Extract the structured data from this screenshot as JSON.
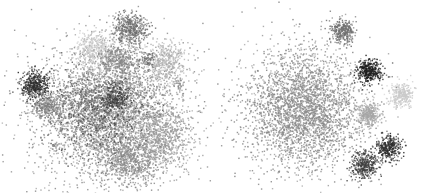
{
  "figure": {
    "width": 429,
    "height": 193,
    "background": "#ffffff"
  },
  "chart_data": [
    {
      "type": "scatter",
      "title": "",
      "xlabel": "",
      "ylabel": "",
      "axes_visible": false,
      "grid": false,
      "legend": null,
      "panel": {
        "x": 0,
        "width": 215
      },
      "description": "t-SNE style embedding with a large overlapping central mass and several satellite clusters, grayscale",
      "clusters": [
        {
          "cx": 105,
          "cy": 112,
          "sx": 38,
          "sy": 36,
          "n": 2600,
          "color": "#8c8c8c"
        },
        {
          "cx": 95,
          "cy": 100,
          "sx": 22,
          "sy": 18,
          "n": 700,
          "color": "#7a7a7a"
        },
        {
          "cx": 130,
          "cy": 120,
          "sx": 30,
          "sy": 24,
          "n": 900,
          "color": "#959595"
        },
        {
          "cx": 115,
          "cy": 97,
          "sx": 7,
          "sy": 7,
          "n": 220,
          "color": "#3a3a3a"
        },
        {
          "cx": 100,
          "cy": 118,
          "sx": 26,
          "sy": 22,
          "n": 400,
          "color": "#4a4a4a"
        },
        {
          "cx": 130,
          "cy": 158,
          "sx": 15,
          "sy": 12,
          "n": 600,
          "color": "#8a8a8a"
        },
        {
          "cx": 163,
          "cy": 140,
          "sx": 14,
          "sy": 14,
          "n": 500,
          "color": "#9a9a9a"
        },
        {
          "cx": 130,
          "cy": 28,
          "sx": 9,
          "sy": 8,
          "n": 450,
          "color": "#6e6e6e"
        },
        {
          "cx": 95,
          "cy": 50,
          "sx": 11,
          "sy": 9,
          "n": 420,
          "color": "#c4c4c4"
        },
        {
          "cx": 120,
          "cy": 60,
          "sx": 12,
          "sy": 9,
          "n": 400,
          "color": "#858585"
        },
        {
          "cx": 165,
          "cy": 62,
          "sx": 10,
          "sy": 11,
          "n": 420,
          "color": "#b2b2b2"
        },
        {
          "cx": 35,
          "cy": 85,
          "sx": 7,
          "sy": 7,
          "n": 420,
          "color": "#2e2e2e"
        },
        {
          "cx": 46,
          "cy": 106,
          "sx": 8,
          "sy": 6,
          "n": 300,
          "color": "#808080"
        },
        {
          "cx": 148,
          "cy": 60,
          "sx": 4,
          "sy": 4,
          "n": 60,
          "color": "#6a6a6a"
        },
        {
          "cx": 178,
          "cy": 83,
          "sx": 3,
          "sy": 3,
          "n": 30,
          "color": "#8a8a8a"
        },
        {
          "cx": 55,
          "cy": 145,
          "sx": 2,
          "sy": 2,
          "n": 12,
          "color": "#808080"
        }
      ]
    },
    {
      "type": "scatter",
      "title": "",
      "xlabel": "",
      "ylabel": "",
      "axes_visible": false,
      "grid": false,
      "legend": null,
      "panel": {
        "x": 215,
        "width": 214
      },
      "description": "t-SNE style embedding with one large diffuse cluster and six compact satellite clusters, grayscale",
      "clusters": [
        {
          "cx": 303,
          "cy": 108,
          "sx": 30,
          "sy": 30,
          "n": 3200,
          "color": "#8a8a8a"
        },
        {
          "cx": 342,
          "cy": 31,
          "sx": 6,
          "sy": 6,
          "n": 320,
          "color": "#707070"
        },
        {
          "cx": 369,
          "cy": 71,
          "sx": 6,
          "sy": 6,
          "n": 380,
          "color": "#1e1e1e"
        },
        {
          "cx": 401,
          "cy": 94,
          "sx": 6,
          "sy": 6,
          "n": 300,
          "color": "#cacaca"
        },
        {
          "cx": 368,
          "cy": 114,
          "sx": 6,
          "sy": 6,
          "n": 320,
          "color": "#a6a6a6"
        },
        {
          "cx": 388,
          "cy": 147,
          "sx": 6,
          "sy": 6,
          "n": 340,
          "color": "#2e2e2e"
        },
        {
          "cx": 364,
          "cy": 164,
          "sx": 7,
          "sy": 7,
          "n": 380,
          "color": "#404040"
        }
      ]
    }
  ]
}
